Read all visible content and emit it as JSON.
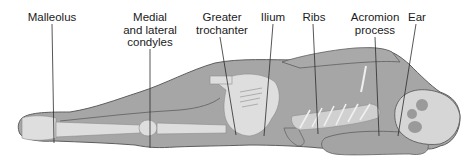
{
  "diagram": {
    "title": "",
    "colors": {
      "background": "#ffffff",
      "body_fill": "#a6a6a6",
      "body_outline": "#5e5e5e",
      "bone_fill": "#dedede",
      "leader_line": "#2b2b2b",
      "label_text": "#1a1a1a"
    },
    "labels": [
      {
        "id": "malleolus",
        "lines": [
          "Malleolus"
        ],
        "x": 52,
        "y": 11,
        "target": [
          54,
          143
        ]
      },
      {
        "id": "condyles",
        "lines": [
          "Medial",
          "and lateral",
          "condyles"
        ],
        "x": 150,
        "y": 11,
        "target": [
          150,
          148
        ]
      },
      {
        "id": "greater-trochanter",
        "lines": [
          "Greater",
          "trochanter"
        ],
        "x": 222,
        "y": 11,
        "target": [
          236,
          135
        ]
      },
      {
        "id": "ilium",
        "lines": [
          "Ilium"
        ],
        "x": 273,
        "y": 11,
        "target": [
          264,
          136
        ]
      },
      {
        "id": "ribs",
        "lines": [
          "Ribs"
        ],
        "x": 314,
        "y": 11,
        "target": [
          318,
          134
        ]
      },
      {
        "id": "acromion-process",
        "lines": [
          "Acromion",
          "process"
        ],
        "x": 375,
        "y": 11,
        "target": [
          379,
          136
        ]
      },
      {
        "id": "ear",
        "lines": [
          "Ear"
        ],
        "x": 417,
        "y": 11,
        "target": [
          398,
          136
        ]
      }
    ]
  }
}
